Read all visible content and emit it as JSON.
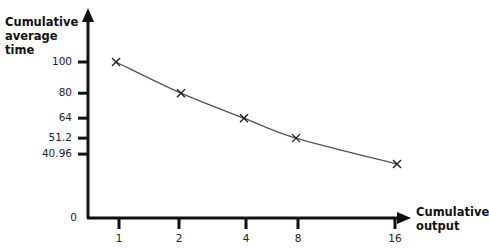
{
  "chart_data": {
    "type": "line",
    "title": "",
    "xlabel": "Cumulative\noutput",
    "ylabel": "Cumulative\naverage\ntime",
    "x": [
      1,
      2,
      4,
      8,
      16
    ],
    "series": [
      {
        "name": "Cumulative average time",
        "values": [
          100,
          80,
          64,
          51.2,
          40.96
        ],
        "marker": "x"
      }
    ],
    "x_ticks": [
      "1",
      "2",
      "4",
      "8",
      "16"
    ],
    "y_ticks": [
      "100",
      "80",
      "64",
      "51.2",
      "40.96"
    ],
    "origin_label": "0",
    "xscale": "log2",
    "grid": false,
    "legend": null,
    "line_color": "#444444",
    "axis_color": "#111111"
  },
  "axes": {
    "x_title": "Cumulative\noutput",
    "y_title": "Cumulative\naverage\ntime",
    "origin": "0"
  }
}
